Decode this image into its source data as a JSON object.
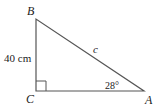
{
  "diagram": {
    "type": "right-triangle",
    "vertices": {
      "B": {
        "label": "B"
      },
      "C": {
        "label": "C"
      },
      "A": {
        "label": "A"
      }
    },
    "sides": {
      "BC": {
        "label": "40 cm"
      },
      "AB": {
        "label": "c"
      }
    },
    "angles": {
      "A": {
        "label": "28°"
      },
      "C": {
        "label": "right angle"
      }
    },
    "colors": {
      "line": "#555555",
      "text": "#222222"
    }
  }
}
